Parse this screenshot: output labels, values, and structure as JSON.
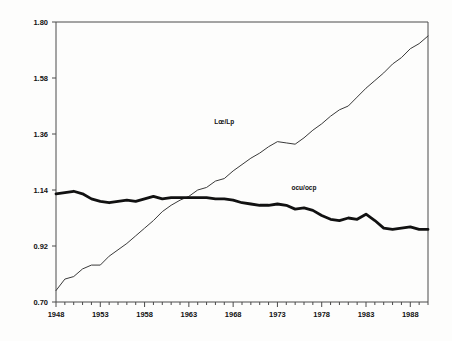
{
  "chart_data": {
    "type": "line",
    "title": "",
    "subtitle": "",
    "xlabel": "",
    "ylabel": "",
    "xlim": [
      1948,
      1990
    ],
    "ylim": [
      0.7,
      1.8
    ],
    "grid": false,
    "legend_position": "inline-annotation",
    "yticks": [
      "1.80",
      "1.58",
      "1.36",
      "1.14",
      "0.92",
      "0.70"
    ],
    "ytick_values": [
      1.8,
      1.58,
      1.36,
      1.14,
      0.92,
      0.7
    ],
    "xticks": [
      "1948",
      "1953",
      "1958",
      "1963",
      "1968",
      "1973",
      "1978",
      "1983",
      "1988"
    ],
    "xtick_values": [
      1948,
      1953,
      1958,
      1963,
      1968,
      1973,
      1978,
      1983,
      1988
    ],
    "minor_xticks_every": 1,
    "x": [
      1948,
      1949,
      1950,
      1951,
      1952,
      1953,
      1954,
      1955,
      1956,
      1957,
      1958,
      1959,
      1960,
      1961,
      1962,
      1963,
      1964,
      1965,
      1966,
      1967,
      1968,
      1969,
      1970,
      1971,
      1972,
      1973,
      1974,
      1975,
      1976,
      1977,
      1978,
      1979,
      1980,
      1981,
      1982,
      1983,
      1984,
      1985,
      1986,
      1987,
      1988,
      1989,
      1990
    ],
    "series": [
      {
        "name": "Lœ/Lp",
        "label": "Lœ/Lp",
        "style": "thin",
        "color": "#3a3a3a",
        "width": 1.0,
        "label_x": 1967,
        "label_y": 1.4,
        "values": [
          0.745,
          0.79,
          0.8,
          0.83,
          0.845,
          0.845,
          0.88,
          0.905,
          0.93,
          0.96,
          0.99,
          1.02,
          1.055,
          1.08,
          1.1,
          1.115,
          1.14,
          1.15,
          1.175,
          1.185,
          1.215,
          1.24,
          1.265,
          1.285,
          1.31,
          1.33,
          1.325,
          1.32,
          1.345,
          1.375,
          1.4,
          1.43,
          1.455,
          1.47,
          1.505,
          1.54,
          1.57,
          1.6,
          1.635,
          1.66,
          1.695,
          1.715,
          1.745
        ]
      },
      {
        "name": "ocu/ocp",
        "label": "ocu/ocp",
        "style": "thick",
        "color": "#111111",
        "width": 2.8,
        "label_x": 1976,
        "label_y": 1.14,
        "values": [
          1.125,
          1.13,
          1.135,
          1.125,
          1.105,
          1.095,
          1.09,
          1.095,
          1.1,
          1.095,
          1.105,
          1.115,
          1.105,
          1.11,
          1.11,
          1.11,
          1.11,
          1.11,
          1.105,
          1.105,
          1.1,
          1.09,
          1.085,
          1.08,
          1.08,
          1.085,
          1.08,
          1.065,
          1.07,
          1.06,
          1.04,
          1.025,
          1.02,
          1.03,
          1.025,
          1.045,
          1.02,
          0.99,
          0.985,
          0.99,
          0.995,
          0.985,
          0.985
        ]
      }
    ]
  },
  "plot": {
    "left": 56,
    "right": 428,
    "top": 22,
    "bottom": 302,
    "frame_color": "#4a4a4a",
    "background": "#fdfdfc"
  }
}
